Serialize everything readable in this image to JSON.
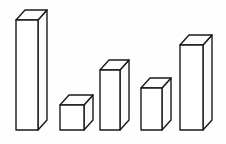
{
  "figure": {
    "title": "3D Bar Chart Line Drawing",
    "background_color": "#fefefe",
    "stroke_color": "#1a1a1a",
    "fill_color": "#ffffff",
    "width": 226,
    "height": 144
  },
  "chart_data": {
    "type": "bar",
    "title": "3D Bar Chart Line Drawing",
    "subtitle": "",
    "xlabel": "",
    "ylabel": "",
    "categories": [
      "1",
      "2",
      "3",
      "4",
      "5"
    ],
    "values": [
      110,
      25,
      60,
      42,
      85
    ],
    "ylim": [
      0,
      120
    ],
    "grid": false,
    "legend": null,
    "axis_visible": false,
    "tick_labels_visible": false,
    "style": "isometric-3d-outline",
    "baseline_y": 130,
    "depth_dx": 9,
    "depth_dy": -10,
    "bars": [
      {
        "name": "bar-1",
        "value": 110,
        "front_left": 16,
        "front_right": 38,
        "front_top": 20,
        "front_bottom": 130
      },
      {
        "name": "bar-2",
        "value": 25,
        "front_left": 60,
        "front_right": 84,
        "front_top": 105,
        "front_bottom": 130
      },
      {
        "name": "bar-3",
        "value": 60,
        "front_left": 100,
        "front_right": 120,
        "front_top": 70,
        "front_bottom": 130
      },
      {
        "name": "bar-4",
        "value": 42,
        "front_left": 141,
        "front_right": 162,
        "front_top": 88,
        "front_bottom": 130
      },
      {
        "name": "bar-5",
        "value": 85,
        "front_left": 180,
        "front_right": 203,
        "front_top": 45,
        "front_bottom": 130
      }
    ]
  }
}
